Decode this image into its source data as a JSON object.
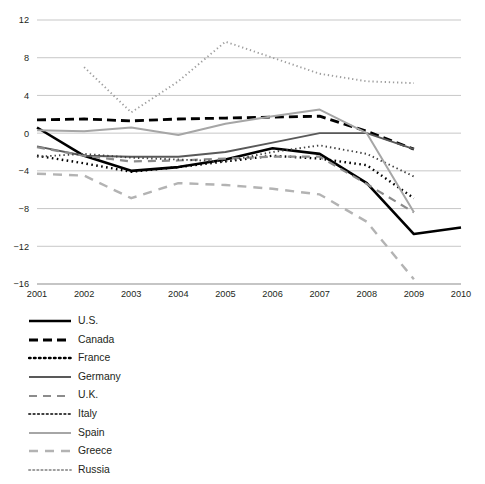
{
  "chart_data": {
    "type": "line",
    "title": "",
    "subtitle": "",
    "xlabel": "",
    "ylabel": "",
    "xlim": [
      2001,
      2010
    ],
    "ylim": [
      -16,
      12
    ],
    "grid": true,
    "legend_position": "below-left",
    "x": [
      2001,
      2002,
      2003,
      2004,
      2005,
      2006,
      2007,
      2008,
      2009,
      2010
    ],
    "yticks": [
      12,
      8,
      4,
      0,
      -4,
      -8,
      -12,
      -16
    ],
    "ytick_labels": [
      "12",
      "8",
      "4",
      "0",
      "−4",
      "−8",
      "−12",
      "−16"
    ],
    "xticks": [
      2001,
      2002,
      2003,
      2004,
      2005,
      2006,
      2007,
      2008,
      2009,
      2010
    ],
    "xtick_labels": [
      "2001",
      "2002",
      "2003",
      "2004",
      "2005",
      "2006",
      "2007",
      "2008",
      "2009",
      "2010"
    ],
    "series": [
      {
        "name": "U.S.",
        "style": "solid",
        "color": "#000000",
        "width": 2.6,
        "dash": "",
        "x": [
          2001,
          2002,
          2003,
          2004,
          2005,
          2006,
          2007,
          2008,
          2009,
          2010
        ],
        "values": [
          0.6,
          -2.4,
          -4.0,
          -3.6,
          -2.8,
          -1.6,
          -2.2,
          -5.3,
          -10.7,
          -10.0
        ]
      },
      {
        "name": "Canada",
        "style": "dashed",
        "color": "#000000",
        "width": 2.8,
        "dash": "9,5",
        "x": [
          2001,
          2002,
          2003,
          2004,
          2005,
          2006,
          2007,
          2008,
          2009,
          2010
        ],
        "values": [
          1.4,
          1.5,
          1.3,
          1.5,
          1.6,
          1.7,
          1.8,
          0.2,
          -1.7,
          null
        ]
      },
      {
        "name": "France",
        "style": "dotted",
        "color": "#000000",
        "width": 2.4,
        "dash": "1.6,3.4",
        "x": [
          2001,
          2002,
          2003,
          2004,
          2005,
          2006,
          2007,
          2008,
          2009,
          2010
        ],
        "values": [
          -2.4,
          -3.2,
          -4.1,
          -3.6,
          -3.0,
          -2.4,
          -2.7,
          -3.4,
          -6.9,
          null
        ]
      },
      {
        "name": "Germany",
        "style": "solid",
        "color": "#595959",
        "width": 1.9,
        "dash": "",
        "x": [
          2001,
          2002,
          2003,
          2004,
          2005,
          2006,
          2007,
          2008,
          2009,
          2010
        ],
        "values": [
          -1.4,
          -2.4,
          -2.5,
          -2.5,
          -2.0,
          -1.0,
          0.0,
          0.0,
          -1.7,
          null
        ]
      },
      {
        "name": "U.K.",
        "style": "dashed",
        "color": "#8c8c8c",
        "width": 2.2,
        "dash": "8,6",
        "x": [
          2001,
          2002,
          2003,
          2004,
          2005,
          2006,
          2007,
          2008,
          2009,
          2010
        ],
        "values": [
          -1.5,
          -2.4,
          -3.0,
          -2.9,
          -2.7,
          -2.5,
          -2.5,
          -5.4,
          -8.4,
          null
        ]
      },
      {
        "name": "Italy",
        "style": "dotted",
        "color": "#404040",
        "width": 1.9,
        "dash": "1.4,3.0",
        "x": [
          2001,
          2002,
          2003,
          2004,
          2005,
          2006,
          2007,
          2008,
          2009,
          2010
        ],
        "values": [
          -2.5,
          -2.2,
          -2.6,
          -2.8,
          -3.0,
          -2.0,
          -1.3,
          -2.2,
          -4.6,
          null
        ]
      },
      {
        "name": "Spain",
        "style": "solid",
        "color": "#a6a6a6",
        "width": 2.0,
        "dash": "",
        "x": [
          2001,
          2002,
          2003,
          2004,
          2005,
          2006,
          2007,
          2008,
          2009,
          2010
        ],
        "values": [
          0.3,
          0.2,
          0.6,
          -0.2,
          1.0,
          1.8,
          2.5,
          0.0,
          -8.4,
          null
        ]
      },
      {
        "name": "Greece",
        "style": "dashed",
        "color": "#b3b3b3",
        "width": 2.4,
        "dash": "9,7",
        "x": [
          2001,
          2002,
          2003,
          2004,
          2005,
          2006,
          2007,
          2008,
          2009,
          2010
        ],
        "values": [
          -4.3,
          -4.5,
          -6.9,
          -5.3,
          -5.5,
          -5.9,
          -6.5,
          -9.4,
          -15.5,
          null
        ]
      },
      {
        "name": "Russia",
        "style": "dotted",
        "color": "#9e9e9e",
        "width": 1.9,
        "dash": "1.3,2.8",
        "x": [
          2001,
          2002,
          2003,
          2004,
          2005,
          2006,
          2007,
          2008,
          2009,
          2010
        ],
        "values": [
          null,
          7.0,
          2.2,
          5.5,
          9.7,
          8.0,
          6.3,
          5.5,
          5.3,
          null
        ]
      }
    ]
  },
  "legend": {
    "items": [
      {
        "label": "U.S."
      },
      {
        "label": "Canada"
      },
      {
        "label": "France"
      },
      {
        "label": "Germany"
      },
      {
        "label": "U.K."
      },
      {
        "label": "Italy"
      },
      {
        "label": "Spain"
      },
      {
        "label": "Greece"
      },
      {
        "label": "Russia"
      }
    ]
  },
  "colors": {
    "background": "#ffffff",
    "gridline": "#b9b9b9",
    "axis": "#8c8c8c",
    "text": "#231f20"
  }
}
